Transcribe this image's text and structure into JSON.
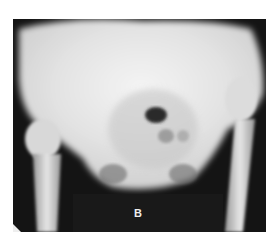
{
  "image": {
    "subject": "pelvis x-ray (AP view)",
    "panel_label": "B"
  }
}
